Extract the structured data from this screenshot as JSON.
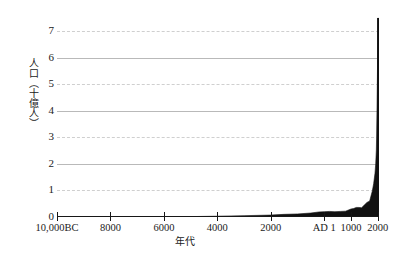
{
  "chart_data": {
    "type": "area",
    "title": "",
    "subtitle": "",
    "xlabel": "年代",
    "ylabel": "人口（十億人）",
    "ylim": [
      0,
      7.8
    ],
    "xlim": [
      -10000,
      2050
    ],
    "grid": true,
    "legend": null,
    "y_ticks": [
      {
        "value": 7,
        "label": "7",
        "gridstyle": "dashed"
      },
      {
        "value": 6,
        "label": "6",
        "gridstyle": "solid"
      },
      {
        "value": 5,
        "label": "5",
        "gridstyle": "dashed"
      },
      {
        "value": 4,
        "label": "4",
        "gridstyle": "solid"
      },
      {
        "value": 3,
        "label": "3",
        "gridstyle": "dashed"
      },
      {
        "value": 2,
        "label": "2",
        "gridstyle": "solid"
      },
      {
        "value": 1,
        "label": "1",
        "gridstyle": "dashed"
      },
      {
        "value": 0,
        "label": "0",
        "gridstyle": "none"
      }
    ],
    "x_ticks": [
      {
        "value": -10000,
        "label": "10,000BC"
      },
      {
        "value": -8000,
        "label": "8000"
      },
      {
        "value": -6000,
        "label": "6000"
      },
      {
        "value": -4000,
        "label": "4000"
      },
      {
        "value": -2000,
        "label": "2000"
      },
      {
        "value": 1,
        "label": "AD 1"
      },
      {
        "value": 1000,
        "label": "1000"
      },
      {
        "value": 2000,
        "label": "2000"
      }
    ],
    "series": [
      {
        "name": "世界人口",
        "color": "#111111",
        "x": [
          -10000,
          -9000,
          -8000,
          -7000,
          -6000,
          -5000,
          -4000,
          -3000,
          -2000,
          -1500,
          -1000,
          -500,
          -200,
          1,
          200,
          400,
          600,
          800,
          1000,
          1100,
          1200,
          1300,
          1400,
          1500,
          1600,
          1700,
          1750,
          1800,
          1850,
          1900,
          1927,
          1950,
          1960,
          1974,
          1987,
          1999,
          2011,
          2020
        ],
        "values": [
          0.004,
          0.005,
          0.006,
          0.007,
          0.01,
          0.015,
          0.03,
          0.05,
          0.072,
          0.1,
          0.115,
          0.15,
          0.19,
          0.2,
          0.21,
          0.2,
          0.21,
          0.22,
          0.3,
          0.32,
          0.36,
          0.36,
          0.35,
          0.45,
          0.55,
          0.6,
          0.79,
          0.98,
          1.26,
          1.65,
          2.0,
          2.52,
          3.0,
          4.0,
          5.0,
          6.0,
          7.0,
          7.5
        ]
      }
    ]
  },
  "axes": {
    "y_title": "人口（十億人）",
    "x_title": "年代"
  }
}
